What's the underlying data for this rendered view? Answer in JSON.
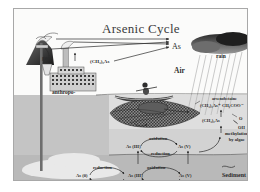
{
  "diagram": {
    "title": "Arsenic Cycle",
    "type": "biogeochemical-cycle-diagram"
  },
  "labels": {
    "as": "As",
    "air": "Air",
    "rain": "rain",
    "geo": "geo-",
    "anthropo": "anthropo-",
    "trimethylarsine": "(CH₃)₃As",
    "arsenobetaine": "arsenobetaine",
    "arsenobetaine_formula": "(CH₃)₃As⁺ CH₂COO⁻",
    "dimethylarsinic": "(CH₃)₂As",
    "oxygen": "O",
    "hydroxyl": "OH",
    "methylation": "methylation\nby algae",
    "methylation_line1": "methylation",
    "methylation_line2": "by algae",
    "sediment": "Sediment"
  },
  "water_column_redox": {
    "oxidation_top": "oxidation",
    "reduction_bottom": "reduction",
    "species_left": "As (III)",
    "species_right": "As (V)"
  },
  "sediment_redox": {
    "left_pair": {
      "reduction_top": "reduction",
      "oxidation_bottom": "oxidation",
      "species_left": "As (0)",
      "species_right": "As (III)"
    },
    "right_pair": {
      "oxidation_top": "oxidation",
      "reduction_bottom": "reduction",
      "species_left": "As (III)",
      "species_right": "As (V)"
    }
  },
  "icons": {
    "volcano": "volcano-icon",
    "factory": "factory-icon",
    "well_pump": "well-pump-icon",
    "rain_cloud": "rain-cloud-icon",
    "boat": "boat-icon",
    "algae": "algae-icon"
  },
  "colors": {
    "page_background": "#ffffff",
    "plate_background": "#f5f5f3",
    "sky": "#fbfbfa",
    "ground": "#c4c4c4",
    "water_upper": "#dedede",
    "water_lower": "#d2d2d2",
    "sediment_band": "#b9b9b9",
    "aquifer": "#e9e9e9",
    "ink": "#2b2b2b",
    "border": "#a8a8a8"
  }
}
